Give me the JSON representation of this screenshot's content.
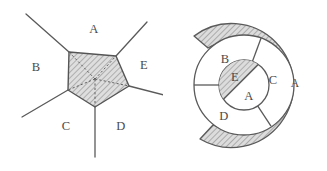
{
  "figure": {
    "title": "",
    "background_color": "#ffffff",
    "stroke_color": "#4a4a4a",
    "hatch_color": "#8c8c8c",
    "fill_color": "#d9d9d9"
  },
  "left_diagram": {
    "name": "pentagon-network-diagram",
    "description": "Shaded pentagon with five external rays and dashed spokes from center to vertices",
    "region_labels": [
      {
        "id": "A",
        "text": "A",
        "x": 94,
        "y": 30
      },
      {
        "id": "B",
        "text": "B",
        "x": 36,
        "y": 68
      },
      {
        "id": "E",
        "text": "E",
        "x": 144,
        "y": 66
      },
      {
        "id": "C",
        "text": "C",
        "x": 66,
        "y": 126
      },
      {
        "id": "D",
        "text": "D",
        "x": 121,
        "y": 126
      }
    ],
    "pentagon_vertices": [
      {
        "x": 69,
        "y": 52
      },
      {
        "x": 116,
        "y": 56
      },
      {
        "x": 129,
        "y": 86
      },
      {
        "x": 95,
        "y": 107
      },
      {
        "x": 68,
        "y": 90
      }
    ],
    "center": {
      "x": 95,
      "y": 79
    },
    "external_rays": [
      {
        "from": {
          "x": 69,
          "y": 52
        },
        "to": {
          "x": 26,
          "y": 14
        }
      },
      {
        "from": {
          "x": 116,
          "y": 56
        },
        "to": {
          "x": 147,
          "y": 22
        }
      },
      {
        "from": {
          "x": 129,
          "y": 86
        },
        "to": {
          "x": 163,
          "y": 94
        }
      },
      {
        "from": {
          "x": 95,
          "y": 107
        },
        "to": {
          "x": 95,
          "y": 156
        }
      },
      {
        "from": {
          "x": 68,
          "y": 90
        },
        "to": {
          "x": 23,
          "y": 116
        }
      }
    ]
  },
  "right_diagram": {
    "name": "concentric-spiral-diagram",
    "description": "Concentric rings: shaded outer spiral band labelled A, middle ring split into B, C, D, inner circle split diagonally into E and A",
    "center": {
      "x": 81,
      "y": 85
    },
    "radii": {
      "inner_circle": 25,
      "middle_ring_outer": 50,
      "spiral_band_inner": 56,
      "spiral_band_outer": 76
    },
    "region_labels": [
      {
        "id": "outer-A",
        "text": "A",
        "x": 132,
        "y": 84
      },
      {
        "id": "middle-B",
        "text": "B",
        "x": 62,
        "y": 60
      },
      {
        "id": "middle-C",
        "text": "C",
        "x": 109,
        "y": 81
      },
      {
        "id": "middle-D",
        "text": "D",
        "x": 61,
        "y": 116
      },
      {
        "id": "inner-E",
        "text": "E",
        "x": 72,
        "y": 78
      },
      {
        "id": "inner-A",
        "text": "A",
        "x": 85,
        "y": 96
      }
    ],
    "middle_ring_divider_angles_deg": [
      -60,
      20,
      180
    ],
    "inner_chord_angle_deg": 35
  }
}
